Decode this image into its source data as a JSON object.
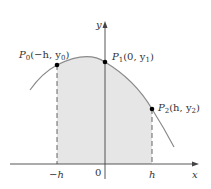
{
  "diagram": {
    "colors": {
      "curve": "#8a8a8a",
      "fill": "#e6e6e6",
      "axis": "#444444",
      "point": "#000000",
      "dashed": "#555555"
    },
    "axes": {
      "x_label": "x",
      "y_label": "y",
      "ticks": [
        {
          "label": "−h"
        },
        {
          "label": "0"
        },
        {
          "label": "h"
        }
      ]
    },
    "points": [
      {
        "name": "P",
        "sub": "0",
        "coords_a": "(−h, y",
        "coords_sub": "0",
        "coords_b": ")"
      },
      {
        "name": "P",
        "sub": "1",
        "coords_a": "(0, y",
        "coords_sub": "1",
        "coords_b": ")"
      },
      {
        "name": "P",
        "sub": "2",
        "coords_a": "(h, y",
        "coords_sub": "2",
        "coords_b": ")"
      }
    ]
  }
}
